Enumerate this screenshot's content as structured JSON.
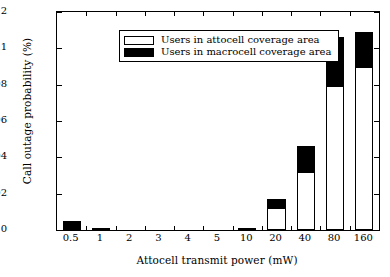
{
  "chart_data": {
    "type": "bar",
    "title": "",
    "subtitle": "",
    "xlabel": "Attocell transmit power (mW)",
    "ylabel": "Call outage probability (%)",
    "stacked": true,
    "grid": false,
    "legend_position": "top-left",
    "categories": [
      "0.5",
      "1",
      "2",
      "3",
      "4",
      "5",
      "10",
      "20",
      "40",
      "80",
      "160"
    ],
    "series": [
      {
        "name": "Users in attocell coverage area",
        "color": "#ffffff",
        "values": [
          0.0,
          0.0012,
          0.0,
          0.0,
          0.0,
          0.0,
          0.0004,
          0.012,
          0.032,
          0.079,
          0.09
        ]
      },
      {
        "name": "Users in macrocell coverage area",
        "color": "#000000",
        "values": [
          0.005,
          0.0,
          0.0,
          0.0,
          0.0,
          0.0,
          0.0,
          0.005,
          0.014,
          0.027,
          0.019
        ]
      }
    ],
    "totals": [
      0.005,
      0.0012,
      0.0,
      0.0,
      0.0,
      0.0,
      0.0004,
      0.017,
      0.046,
      0.106,
      0.109
    ],
    "xlim": [
      0,
      11
    ],
    "ylim": [
      0,
      0.12
    ],
    "yticks": [
      0,
      0.02,
      0.04,
      0.06,
      0.08,
      0.1,
      0.12
    ],
    "ytick_labels": [
      "0",
      "0.02",
      "0.04",
      "0.06",
      "0.08",
      "0.1",
      "0.12"
    ]
  },
  "legend": {
    "items": [
      {
        "label": "Users in attocell coverage area",
        "swatch": "white"
      },
      {
        "label": "Users in macrocell coverage area",
        "swatch": "black"
      }
    ]
  }
}
